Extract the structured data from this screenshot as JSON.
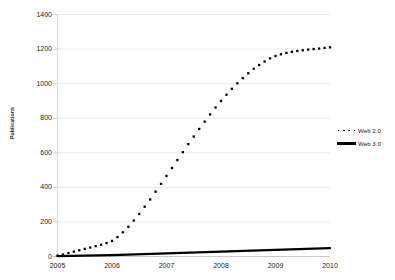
{
  "chart_data": {
    "type": "line",
    "title": "",
    "subtitle": "",
    "xlabel": "",
    "ylabel": "Publications",
    "xlim": [
      2005,
      2010
    ],
    "ylim": [
      0,
      1400
    ],
    "yticks": [
      0,
      200,
      400,
      600,
      800,
      1000,
      1200,
      1400
    ],
    "xticks": [
      2005,
      2006,
      2007,
      2008,
      2009,
      2010
    ],
    "xtick_labels": [
      "2005",
      "2006",
      "2007",
      "2008",
      "2009",
      "2010"
    ],
    "ytick_labels": [
      "0",
      "200",
      "400",
      "600",
      "800",
      "1000",
      "1200",
      "1400"
    ],
    "grid": "horizontal",
    "legend_position": "right",
    "series": [
      {
        "name": "Web 2.0",
        "style": "dotted",
        "color": "#000000",
        "x": [
          2005.0,
          2005.1,
          2005.2,
          2005.3,
          2005.4,
          2005.5,
          2005.6,
          2005.7,
          2005.8,
          2005.9,
          2006.0,
          2006.1,
          2006.2,
          2006.3,
          2006.4,
          2006.5,
          2006.6,
          2006.7,
          2006.8,
          2006.9,
          2007.0,
          2007.1,
          2007.2,
          2007.3,
          2007.4,
          2007.5,
          2007.6,
          2007.7,
          2007.8,
          2007.9,
          2008.0,
          2008.1,
          2008.2,
          2008.3,
          2008.4,
          2008.5,
          2008.6,
          2008.7,
          2008.8,
          2008.9,
          2009.0,
          2009.1,
          2009.2,
          2009.3,
          2009.4,
          2009.5,
          2009.6,
          2009.7,
          2009.8,
          2009.9,
          2010.0
        ],
        "values": [
          5,
          12,
          20,
          28,
          36,
          44,
          52,
          60,
          68,
          78,
          90,
          112,
          140,
          172,
          208,
          246,
          288,
          330,
          375,
          420,
          466,
          512,
          558,
          604,
          650,
          694,
          738,
          780,
          822,
          862,
          900,
          936,
          970,
          1002,
          1032,
          1060,
          1086,
          1108,
          1128,
          1146,
          1160,
          1170,
          1178,
          1184,
          1189,
          1193,
          1197,
          1200,
          1203,
          1207,
          1210
        ]
      },
      {
        "name": "Web 3.0",
        "style": "solid",
        "color": "#000000",
        "x": [
          2005,
          2006,
          2007,
          2008,
          2009,
          2010
        ],
        "values": [
          2,
          8,
          18,
          28,
          38,
          48
        ]
      }
    ]
  },
  "legend": {
    "items": [
      {
        "label": "Web 2.0",
        "marker": "dotted-line-marker"
      },
      {
        "label": "Web 3.0",
        "marker": "solid-line-marker"
      }
    ]
  },
  "axes": {
    "y_title": "Publications"
  },
  "colors": {
    "series": "#000000",
    "gridline": "#ebebeb",
    "axis": "#d9d9d9",
    "text": "#1a1a1a",
    "background": "#ffffff"
  }
}
